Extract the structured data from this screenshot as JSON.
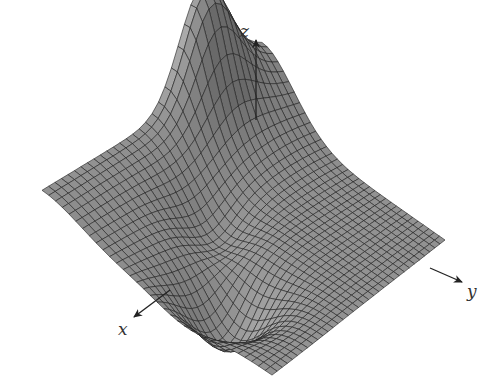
{
  "figure": {
    "type": "3d-surface-plot",
    "axes": {
      "x": {
        "label": "x"
      },
      "y": {
        "label": "y"
      },
      "z": {
        "label": "z"
      }
    },
    "colors": {
      "surface": "#8c8c8c",
      "surface_light": "#a4a4a4",
      "mesh": "#1e1e1e",
      "axis": "#222222",
      "background": "#ffffff"
    }
  }
}
